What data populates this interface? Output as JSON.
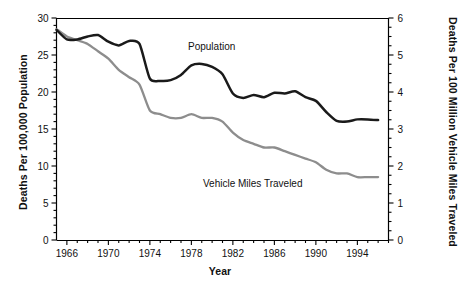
{
  "chart_data": {
    "type": "line",
    "title": "",
    "xlabel": "Year",
    "ylabel": "Deaths Per 100,000 Population",
    "ylabel_right": "Deaths Per 100 Million Vehicle Miles Traveled",
    "xlim": [
      1965,
      1997
    ],
    "ylim": [
      0,
      30
    ],
    "ylim_right": [
      0,
      6
    ],
    "grid": false,
    "legend_position": "inline-annotation",
    "xticks": [
      1966,
      1970,
      1974,
      1978,
      1982,
      1986,
      1990,
      1994
    ],
    "xtick_labels": [
      "1966",
      "1970",
      "1974",
      "1978",
      "1982",
      "1986",
      "1990",
      "1994"
    ],
    "xminor_step": 1,
    "yticks": [
      0,
      5,
      10,
      15,
      20,
      25,
      30
    ],
    "ytick_labels": [
      "0",
      "5",
      "10",
      "15",
      "20",
      "25",
      "30"
    ],
    "yminor_step": 1,
    "yticks_right": [
      0,
      1,
      2,
      3,
      4,
      5,
      6
    ],
    "ytick_labels_right": [
      "0",
      "1",
      "2",
      "3",
      "4",
      "5",
      "6"
    ],
    "yminor_step_right": 0.25,
    "x": [
      1965,
      1966,
      1967,
      1968,
      1969,
      1970,
      1971,
      1972,
      1973,
      1974,
      1975,
      1976,
      1977,
      1978,
      1979,
      1980,
      1981,
      1982,
      1983,
      1984,
      1985,
      1986,
      1987,
      1988,
      1989,
      1990,
      1991,
      1992,
      1993,
      1994,
      1995,
      1996
    ],
    "series": [
      {
        "name": "Population",
        "axis": "left",
        "color": "#1a1a1a",
        "values": [
          28.4,
          27.1,
          27.1,
          27.5,
          27.7,
          26.8,
          26.3,
          26.9,
          26.5,
          21.8,
          21.5,
          21.6,
          22.3,
          23.6,
          23.8,
          23.4,
          22.4,
          19.8,
          19.2,
          19.6,
          19.3,
          19.9,
          19.8,
          20.1,
          19.3,
          18.8,
          17.3,
          16.1,
          16.0,
          16.3,
          16.3,
          16.2
        ]
      },
      {
        "name": "Vehicle Miles Traveled",
        "axis": "right",
        "color": "#8d8d8d",
        "values": [
          5.7,
          5.5,
          5.4,
          5.3,
          5.1,
          4.9,
          4.6,
          4.4,
          4.2,
          3.5,
          3.4,
          3.3,
          3.3,
          3.4,
          3.3,
          3.3,
          3.2,
          2.9,
          2.7,
          2.6,
          2.5,
          2.5,
          2.4,
          2.3,
          2.2,
          2.1,
          1.9,
          1.8,
          1.8,
          1.7,
          1.7,
          1.7
        ]
      }
    ]
  },
  "labels": {
    "y_left_title": "Deaths Per 100,000 Population",
    "y_right_title": "Deaths Per 100 Million Vehicle Miles Traveled",
    "x_title": "Year",
    "series_population": "Population",
    "series_vmt": "Vehicle Miles Traveled"
  },
  "colors": {
    "population_line": "#1a1a1a",
    "vmt_line": "#8d8d8d",
    "axis": "#000000",
    "text": "#111111",
    "background": "#ffffff"
  }
}
